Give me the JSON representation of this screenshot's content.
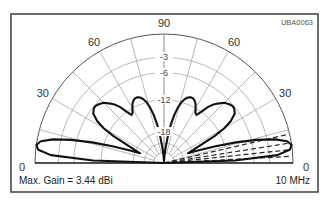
{
  "figure_code": "UBA0063",
  "footer": {
    "max_gain": "Max. Gain = 3.44 dBi",
    "frequency": "10 MHz"
  },
  "colors": {
    "pattern": "#111111",
    "grid": "#9a9a9a",
    "frame": "#4a4a4a"
  },
  "chart_data": {
    "type": "polar",
    "subtype": "elevation-pattern",
    "title": "",
    "annotations": [
      "UBA0063",
      "Max. Gain = 3.44 dBi",
      "10 MHz"
    ],
    "angle_labels": [
      {
        "text": "0",
        "angle": 180
      },
      {
        "text": "30",
        "angle": 150
      },
      {
        "text": "60",
        "angle": 120
      },
      {
        "text": "90",
        "angle": 90
      },
      {
        "text": "60",
        "angle": 60
      },
      {
        "text": "30",
        "angle": 30
      },
      {
        "text": "0",
        "angle": 0
      }
    ],
    "radial_grid_step_deg": 15,
    "ring_labels": [
      "-3",
      "-6",
      "-12",
      "-18"
    ],
    "ring_radii_fraction": [
      1.0,
      0.82,
      0.7,
      0.49,
      0.24,
      0.155,
      0.08
    ],
    "angle_range": [
      0,
      180
    ],
    "grid": true,
    "elevation_deg": [
      0,
      2,
      4,
      6,
      8,
      10,
      12,
      14,
      16,
      18,
      20,
      22,
      25,
      28,
      30,
      32,
      35,
      38,
      40,
      42,
      45,
      48,
      50,
      52,
      54,
      56,
      58,
      60,
      62,
      64,
      66,
      68,
      70,
      72,
      74,
      76,
      78,
      80,
      82,
      84,
      86,
      88,
      90
    ],
    "relative_radius": [
      0.0,
      0.55,
      0.88,
      0.98,
      1.0,
      0.97,
      0.88,
      0.74,
      0.58,
      0.42,
      0.28,
      0.2,
      0.28,
      0.44,
      0.54,
      0.61,
      0.67,
      0.69,
      0.69,
      0.68,
      0.66,
      0.62,
      0.59,
      0.55,
      0.49,
      0.45,
      0.46,
      0.49,
      0.52,
      0.54,
      0.55,
      0.55,
      0.54,
      0.52,
      0.49,
      0.44,
      0.38,
      0.3,
      0.2,
      0.12,
      0.06,
      0.02,
      0.0
    ],
    "comparison_lines_deg": [
      3,
      6,
      9,
      13
    ],
    "max_gain_dbi": 3.44,
    "frequency": "10 MHz"
  }
}
